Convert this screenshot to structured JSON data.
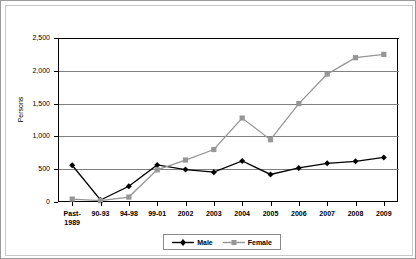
{
  "chart_data": {
    "type": "line",
    "title": "",
    "xlabel": "",
    "ylabel": "Persons",
    "ylim": [
      0,
      2500
    ],
    "yticks": [
      0,
      500,
      1000,
      1500,
      2000,
      2500
    ],
    "ytick_labels": [
      "0",
      "500",
      "1,000",
      "1,500",
      "2,000",
      "2,500"
    ],
    "grid": true,
    "legend_position": "bottom",
    "categories": [
      "Past-1989",
      "90-93",
      "94-98",
      "99-01",
      "2002",
      "2003",
      "2004",
      "2005",
      "2006",
      "2007",
      "2008",
      "2009"
    ],
    "category_lines": [
      [
        "Past-",
        "1989"
      ],
      [
        "90-93"
      ],
      [
        "94-98"
      ],
      [
        "99-01"
      ],
      [
        "2002"
      ],
      [
        "2003"
      ],
      [
        "2004"
      ],
      [
        "2005"
      ],
      [
        "2006"
      ],
      [
        "2007"
      ],
      [
        "2008"
      ],
      [
        "2009"
      ]
    ],
    "series": [
      {
        "name": "Male",
        "color": "#000000",
        "marker": "diamond",
        "values": [
          560,
          30,
          240,
          565,
          495,
          455,
          625,
          420,
          520,
          590,
          620,
          680
        ]
      },
      {
        "name": "Female",
        "color": "#969696",
        "marker": "square",
        "values": [
          45,
          20,
          75,
          490,
          640,
          800,
          1280,
          950,
          1500,
          1950,
          2200,
          2250
        ]
      }
    ]
  },
  "legend": {
    "entries": [
      {
        "label": "Male"
      },
      {
        "label": "Female"
      }
    ]
  }
}
